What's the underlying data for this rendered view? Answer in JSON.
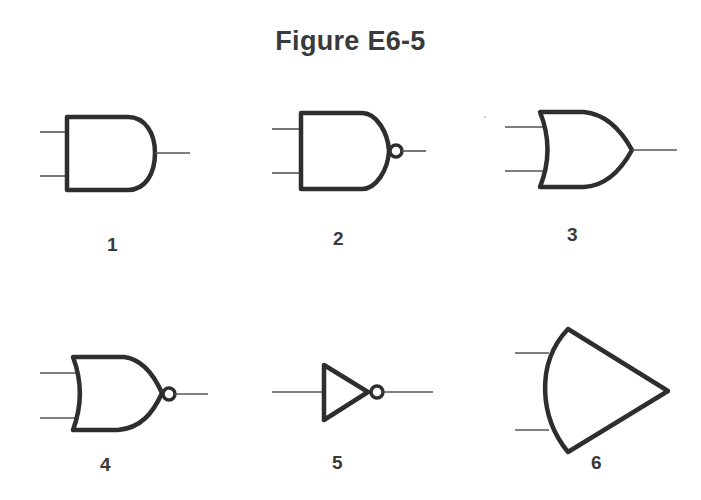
{
  "figure": {
    "title": "Figure E6-5",
    "colors": {
      "stroke": "#2e2e2e",
      "wire": "#555555",
      "text": "#3a3a3a",
      "background": "#ffffff"
    },
    "gates": [
      {
        "id": 1,
        "label": "1",
        "symbol": "and-gate",
        "inputs": 2
      },
      {
        "id": 2,
        "label": "2",
        "symbol": "nand-gate",
        "inputs": 2
      },
      {
        "id": 3,
        "label": "3",
        "symbol": "or-gate",
        "inputs": 2
      },
      {
        "id": 4,
        "label": "4",
        "symbol": "nor-gate",
        "inputs": 2
      },
      {
        "id": 5,
        "label": "5",
        "symbol": "not-gate",
        "inputs": 1
      },
      {
        "id": 6,
        "label": "6",
        "symbol": "curved-triangle-gate",
        "inputs": 2
      }
    ]
  }
}
